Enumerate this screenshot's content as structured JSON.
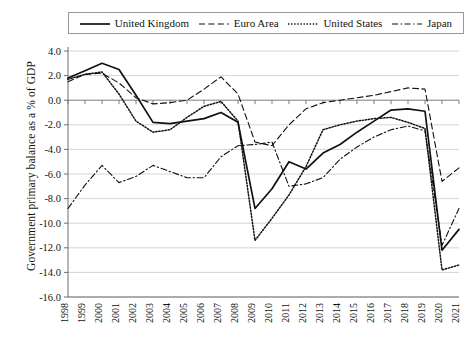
{
  "chart_data": {
    "type": "line",
    "title": "",
    "xlabel": "",
    "ylabel": "Government primary balance as a % of GDP",
    "ylim": [
      -16.0,
      4.0
    ],
    "ytick_step": 2.0,
    "yticks": [
      "4.0",
      "2.0",
      "0.0",
      "-2.0",
      "-4.0",
      "-6.0",
      "-8.0",
      "-10.0",
      "-12.0",
      "-14.0",
      "-16.0"
    ],
    "grid": true,
    "legend_position": "top",
    "x": [
      "1998",
      "1999",
      "2000",
      "2001",
      "2002",
      "2003",
      "2004",
      "2005",
      "2006",
      "2007",
      "2008",
      "2009",
      "2010",
      "2011",
      "2012",
      "2013",
      "2014",
      "2015",
      "2016",
      "2017",
      "2018",
      "2019",
      "2020",
      "2021"
    ],
    "series": [
      {
        "name": "United Kingdom",
        "style": "solid",
        "color": "#111111",
        "values": [
          1.8,
          2.4,
          3.0,
          2.5,
          0.4,
          -1.8,
          -1.9,
          -1.7,
          -1.5,
          -1.0,
          -1.8,
          -8.8,
          -7.2,
          -5.0,
          -5.6,
          -4.3,
          -3.6,
          -2.6,
          -1.7,
          -0.8,
          -0.7,
          -0.9,
          -12.2,
          -10.5
        ]
      },
      {
        "name": "Euro Area",
        "style": "dashed",
        "color": "#111111",
        "values": [
          1.5,
          2.1,
          2.2,
          1.4,
          0.2,
          -0.3,
          -0.2,
          0.0,
          0.9,
          1.9,
          0.5,
          -3.4,
          -3.7,
          -2.0,
          -0.7,
          -0.2,
          0.0,
          0.2,
          0.4,
          0.7,
          1.0,
          0.9,
          -6.6,
          -5.5
        ]
      },
      {
        "name": "United States",
        "style": "dotted",
        "color": "#111111",
        "values": [
          1.7,
          2.1,
          2.3,
          0.5,
          -1.7,
          -2.6,
          -2.4,
          -1.4,
          -0.5,
          -0.1,
          -1.7,
          -11.4,
          -9.6,
          -7.7,
          -5.4,
          -2.4,
          -2.0,
          -1.7,
          -1.5,
          -1.4,
          -1.8,
          -2.3,
          -13.8,
          -13.4
        ]
      },
      {
        "name": "Japan",
        "style": "dashdot",
        "color": "#111111",
        "values": [
          -8.8,
          -6.9,
          -5.3,
          -6.7,
          -6.2,
          -5.3,
          -5.8,
          -6.3,
          -6.3,
          -4.6,
          -3.7,
          -3.6,
          -3.4,
          -7.0,
          -6.8,
          -6.3,
          -4.8,
          -3.8,
          -3.0,
          -2.4,
          -2.1,
          -2.5,
          -11.8,
          -8.8
        ]
      }
    ]
  },
  "legend": {
    "items": [
      {
        "label": "United Kingdom",
        "style": "solid"
      },
      {
        "label": "Euro Area",
        "style": "dashed"
      },
      {
        "label": "United States",
        "style": "dotted"
      },
      {
        "label": "Japan",
        "style": "dashdot"
      }
    ]
  }
}
